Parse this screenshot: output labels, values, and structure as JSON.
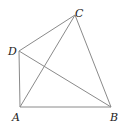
{
  "diagram": {
    "line_color": "#8a8a8a",
    "label_color": "#222222",
    "points": {
      "A": {
        "label": "A",
        "x": 20,
        "y": 107
      },
      "B": {
        "label": "B",
        "x": 111,
        "y": 107
      },
      "C": {
        "label": "C",
        "x": 75,
        "y": 15
      },
      "D": {
        "label": "D",
        "x": 19,
        "y": 51
      }
    },
    "segments": [
      [
        "A",
        "B"
      ],
      [
        "B",
        "C"
      ],
      [
        "C",
        "D"
      ],
      [
        "D",
        "A"
      ],
      [
        "A",
        "C"
      ],
      [
        "D",
        "B"
      ]
    ]
  }
}
